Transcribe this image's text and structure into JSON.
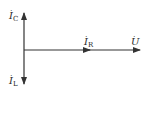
{
  "diagram": {
    "type": "phasor-diagram",
    "stroke_color": "#333333",
    "phasors": [
      {
        "id": "ic",
        "symbol": "I",
        "subscript": "C",
        "dot": "·",
        "direction": "up"
      },
      {
        "id": "il",
        "symbol": "I",
        "subscript": "L",
        "dot": "·",
        "direction": "down"
      },
      {
        "id": "ir",
        "symbol": "I",
        "subscript": "R",
        "dot": "·",
        "direction": "right"
      },
      {
        "id": "u",
        "symbol": "U",
        "subscript": "",
        "dot": "·",
        "direction": "right"
      }
    ]
  }
}
